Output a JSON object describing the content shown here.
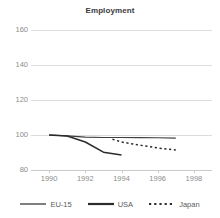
{
  "chart_data": {
    "type": "line",
    "title": "Employment",
    "xlabel": "",
    "ylabel": "",
    "xlim": [
      1989,
      1999
    ],
    "ylim": [
      80,
      160
    ],
    "grid": true,
    "legend_position": "bottom",
    "x_ticks": [
      "1990",
      "1992",
      "1994",
      "1996",
      "1998"
    ],
    "x_tick_values": [
      1990,
      1992,
      1994,
      1996,
      1998
    ],
    "y_ticks": [
      "80",
      "100",
      "120",
      "140",
      "160"
    ],
    "y_tick_values": [
      80,
      100,
      120,
      140,
      160
    ],
    "series": [
      {
        "name": "EU-15",
        "style": "solid",
        "color": "#3f3f3f",
        "width": 1.1,
        "x": [
          1990,
          1991,
          1992,
          1993,
          1994,
          1995,
          1996,
          1997
        ],
        "values": [
          100.0,
          99.5,
          98.8,
          98.6,
          98.6,
          98.5,
          98.4,
          98.2
        ]
      },
      {
        "name": "USA",
        "style": "solid",
        "color": "#2b2b2b",
        "width": 1.5,
        "x": [
          1990,
          1991,
          1992,
          1993,
          1994
        ],
        "values": [
          100.0,
          99.4,
          96.0,
          90.2,
          88.6
        ]
      },
      {
        "name": "Japan",
        "style": "dotted",
        "color": "#2b2b2b",
        "width": 1.5,
        "x": [
          1993.5,
          1994,
          1995,
          1996,
          1997
        ],
        "values": [
          97.6,
          96.0,
          94.2,
          92.6,
          91.4
        ]
      }
    ]
  },
  "legend": {
    "items": [
      {
        "label": "EU-15",
        "style": "solid",
        "width": 1.2
      },
      {
        "label": "USA",
        "style": "solid",
        "width": 2.2
      },
      {
        "label": "Japan",
        "style": "dotted",
        "width": 2.2
      }
    ]
  },
  "colors": {
    "background": "#ffffff",
    "grid": "#dcdcdc",
    "axis": "#c9c9c9",
    "tick_text": "#8c8c8c",
    "title_text": "#3a3a3a",
    "legend_text": "#5a5a5a",
    "line_dark": "#2b2b2b"
  }
}
